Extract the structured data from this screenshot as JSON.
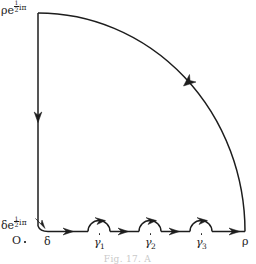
{
  "figure": {
    "type": "complex-plane-contour-diagram",
    "background_color": "#ffffff",
    "stroke_color": "#1d1d1d",
    "caption": "Fig. 17.  A",
    "labels": {
      "top_left_rho": "ρe",
      "top_left_exponent_i_pi": "iπ",
      "bottom_left_delta": "δe",
      "bottom_left_exponent_i_pi": "iπ",
      "exponent_numerator": "1",
      "exponent_denominator": "2",
      "origin": "O",
      "inner_radius": "δ",
      "outer_radius": "ρ",
      "arc_1": "γ",
      "arc_1_sub": "1",
      "arc_2": "γ",
      "arc_2_sub": "2",
      "arc_3": "γ",
      "arc_3_sub": "3"
    },
    "geometry": {
      "origin_x": 38,
      "origin_y": 231,
      "top_y": 13,
      "right_x": 245,
      "delta_x": 48,
      "bump_radius": 11,
      "bump_centers_x": [
        99,
        150,
        201
      ],
      "outer_arc_radius": 207
    }
  }
}
